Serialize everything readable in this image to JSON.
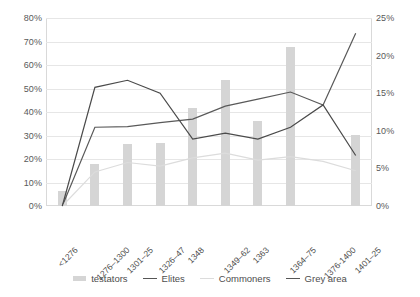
{
  "chart_data": {
    "type": "bar",
    "title": "",
    "xlabel": "",
    "ylabel": "",
    "categories": [
      "<1276",
      "1276–1300",
      "1301–25",
      "1326–47",
      "1348",
      "1349–62",
      "1363",
      "1364–75",
      "1376-1400",
      "1401–25"
    ],
    "axes": {
      "left": {
        "label": "",
        "ylim": [
          0,
          80
        ],
        "ticks": [
          0,
          10,
          20,
          30,
          40,
          50,
          60,
          70,
          80
        ],
        "tick_labels": [
          "0%",
          "10%",
          "20%",
          "30%",
          "40%",
          "50%",
          "60%",
          "70%",
          "80%"
        ]
      },
      "right": {
        "label": "",
        "ylim": [
          0,
          25
        ],
        "ticks": [
          0,
          5,
          10,
          15,
          20,
          25
        ],
        "tick_labels": [
          "0%",
          "5%",
          "10%",
          "15%",
          "20%",
          "25%"
        ]
      }
    },
    "grid": true,
    "legend_position": "bottom",
    "series": [
      {
        "name": "testators",
        "type": "bar",
        "axis": "right",
        "color": "#d5d5d5",
        "values": [
          2.0,
          5.6,
          8.2,
          8.4,
          13.1,
          16.8,
          11.3,
          21.2,
          0.0,
          9.5
        ]
      },
      {
        "name": "Elites",
        "type": "line",
        "axis": "left",
        "color": "#595959",
        "values": [
          0,
          33.5,
          33.8,
          35.5,
          37.0,
          42.5,
          45.5,
          48.5,
          43.0,
          73.5
        ]
      },
      {
        "name": "Commoners",
        "type": "line",
        "axis": "left",
        "color": "#dcdcdc",
        "values": [
          0,
          14.5,
          18.5,
          17.0,
          20.5,
          22.5,
          19.5,
          21.0,
          19.0,
          15.0
        ]
      },
      {
        "name": "Grey area",
        "type": "line",
        "axis": "left",
        "color": "#4a4a4a",
        "values": [
          0,
          50.5,
          53.5,
          48.0,
          28.5,
          31.0,
          28.5,
          33.5,
          43.0,
          21.5
        ]
      }
    ]
  },
  "legend": {
    "items": [
      {
        "label": "testators",
        "marker": "bar"
      },
      {
        "label": "Elites",
        "marker": "line"
      },
      {
        "label": "Commoners",
        "marker": "line-light"
      },
      {
        "label": "Grey area",
        "marker": "line"
      }
    ]
  }
}
